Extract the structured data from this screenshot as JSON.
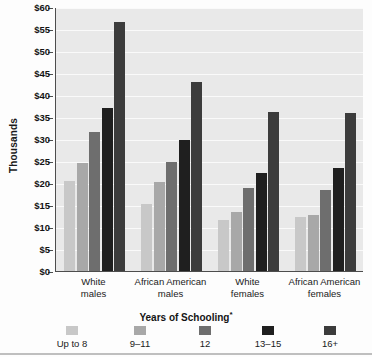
{
  "chart_data": {
    "type": "bar",
    "title": "",
    "xlabel": "Years of Schooling*",
    "ylabel": "Thousands",
    "ylim": [
      0,
      60
    ],
    "ytick_step": 5,
    "ytick_labels": [
      "$60",
      "$55",
      "$50",
      "$45",
      "$40",
      "$35",
      "$30",
      "$25",
      "$20",
      "$15",
      "$10",
      "$5",
      "$0"
    ],
    "ytick_values": [
      60,
      55,
      50,
      45,
      40,
      35,
      30,
      25,
      20,
      15,
      10,
      5,
      0
    ],
    "grid": true,
    "legend_position": "bottom",
    "categories": [
      "White males",
      "African American males",
      "White females",
      "African American females"
    ],
    "category_lines": [
      [
        "White",
        "males"
      ],
      [
        "African American",
        "males"
      ],
      [
        "White",
        "females"
      ],
      [
        "African American",
        "females"
      ]
    ],
    "series": [
      {
        "name": "Up to 8",
        "color": "#c8c8c8",
        "values": [
          20.4,
          15.2,
          11.6,
          12.2
        ]
      },
      {
        "name": "9–11",
        "color": "#a8a8a8",
        "values": [
          24.6,
          20.3,
          13.3,
          12.7
        ]
      },
      {
        "name": "12",
        "color": "#6e6e6e",
        "values": [
          31.7,
          24.7,
          18.9,
          18.3
        ]
      },
      {
        "name": "13–15",
        "color": "#1f1f1f",
        "values": [
          37.1,
          29.8,
          22.3,
          23.4
        ]
      },
      {
        "name": "16+",
        "color": "#3c3c3c",
        "values": [
          56.6,
          42.9,
          36.2,
          35.8
        ]
      }
    ],
    "units": "Thousands of dollars"
  },
  "axis": {
    "y_title": "Thousands",
    "x_title": "Years of Schooling",
    "x_title_footnote": "*"
  },
  "legend": {
    "items": [
      {
        "label": "Up to 8",
        "color": "#c8c8c8"
      },
      {
        "label": "9–11",
        "color": "#a8a8a8"
      },
      {
        "label": "12",
        "color": "#6e6e6e"
      },
      {
        "label": "13–15",
        "color": "#1f1f1f"
      },
      {
        "label": "16+",
        "color": "#3c3c3c"
      }
    ]
  },
  "style": {
    "plot_background": "#e9e9e9",
    "gridline_color": "#fafafa",
    "axis_color": "#4d4d4d",
    "text_color": "#1a1a1a"
  }
}
